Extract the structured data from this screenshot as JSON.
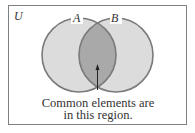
{
  "diagram": {
    "type": "venn",
    "universe_label": "U",
    "sets": [
      {
        "label": "A"
      },
      {
        "label": "B"
      }
    ],
    "annotation": {
      "line1": "Common elements are",
      "line2": "in this region."
    },
    "colors": {
      "circle_fill": "#dcdcdc",
      "intersection_fill": "#a9a9a9",
      "stroke": "#7a7a7a",
      "border": "#808080"
    }
  }
}
